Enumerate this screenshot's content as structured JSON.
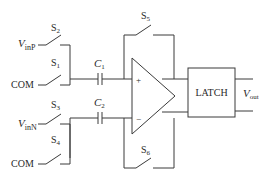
{
  "diagram": {
    "type": "switched-capacitor comparator with latch",
    "switches": [
      {
        "id": "S2",
        "label": "S",
        "sub": "2",
        "input": "VinP"
      },
      {
        "id": "S1",
        "label": "S",
        "sub": "1",
        "input": "COM"
      },
      {
        "id": "S3",
        "label": "S",
        "sub": "3",
        "input": "VinN"
      },
      {
        "id": "S4",
        "label": "S",
        "sub": "4",
        "input": "COM"
      },
      {
        "id": "S5",
        "label": "S",
        "sub": "5",
        "role": "feedback-positive"
      },
      {
        "id": "S6",
        "label": "S",
        "sub": "6",
        "role": "feedback-negative"
      }
    ],
    "capacitors": [
      {
        "id": "C1",
        "label": "C",
        "sub": "1"
      },
      {
        "id": "C2",
        "label": "C",
        "sub": "2"
      }
    ],
    "inputs": {
      "vinp": {
        "main": "V",
        "sub": "inP"
      },
      "vinn": {
        "main": "V",
        "sub": "inN"
      },
      "com1": "COM",
      "com2": "COM"
    },
    "opamp": {
      "plus": "+",
      "minus": "−"
    },
    "latch": {
      "label": "LATCH"
    },
    "output": {
      "main": "V",
      "sub": "out"
    }
  }
}
